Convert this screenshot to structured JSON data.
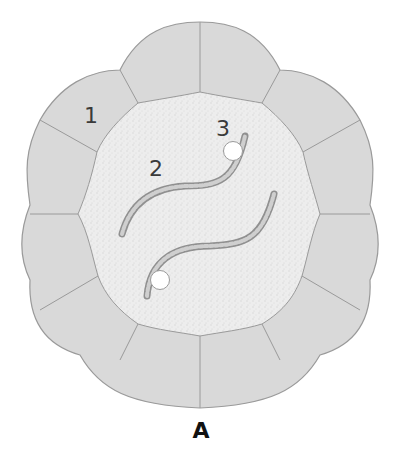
{
  "figure": {
    "caption": "A",
    "labels": [
      {
        "id": "1",
        "text": "1",
        "x": 90,
        "y": 123
      },
      {
        "id": "2",
        "text": "2",
        "x": 156,
        "y": 176
      },
      {
        "id": "3",
        "text": "3",
        "x": 222,
        "y": 136
      }
    ],
    "colors": {
      "cell_fill": "#d8d8d8",
      "cell_border": "#999999",
      "lumen_fill": "#ececec",
      "strand_fill": "#c4c4c4",
      "strand_border": "#8f8f8f",
      "dot_fill": "#ffffff",
      "dot_border": "#9a9a9a"
    },
    "structures": {
      "cells": "surrounding cell ring (label 1)",
      "strands": "twisted strands (label 2)",
      "dots": "white circular bodies (label 3)"
    }
  }
}
